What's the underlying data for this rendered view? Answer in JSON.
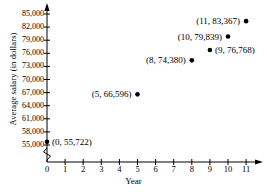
{
  "chart_data": {
    "type": "scatter",
    "title": "",
    "xlabel": "Year",
    "ylabel": "Average salary (in dollars)",
    "x": [
      0,
      5,
      8,
      9,
      10,
      11
    ],
    "values": [
      55722,
      66596,
      74380,
      76768,
      79839,
      83367
    ],
    "point_labels": [
      "(0, 55,722)",
      "(5, 66,596)",
      "(8, 74,380)",
      "(9, 76,768)",
      "(10, 79,839)",
      "(11, 83,367)"
    ],
    "label_anchor": [
      "left",
      "right",
      "right",
      "left",
      "right",
      "right"
    ],
    "xlim": [
      0,
      11
    ],
    "ylim": [
      55000,
      85000
    ],
    "xticks": [
      "0",
      "1",
      "2",
      "3",
      "4",
      "5",
      "6",
      "7",
      "8",
      "9",
      "10",
      "11"
    ],
    "yticks": [
      "55,000",
      "58,000",
      "61,000",
      "64,000",
      "67,000",
      "70,000",
      "73,000",
      "76,000",
      "79,000",
      "82,000",
      "85,000"
    ],
    "ytick_values": [
      55000,
      58000,
      61000,
      64000,
      67000,
      70000,
      73000,
      76000,
      79000,
      82000,
      85000
    ],
    "grid": false,
    "legend": null,
    "axis_break": true,
    "marker": "filled-circle",
    "marker_color": "#000000",
    "axis_color": "#000000"
  }
}
